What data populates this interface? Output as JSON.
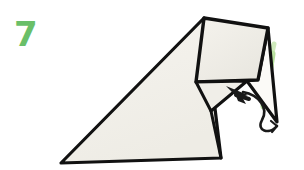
{
  "figure": {
    "step_number": "7",
    "step_number_color": "#6abf68",
    "background_color": "#ffffff",
    "paper_fill_color": "#f2f0ea",
    "paper_shade_color": "#e9e7e0",
    "outline_color": "#111111",
    "arrow_color": "#1a1a1a",
    "fold_hint_color": "#a8d98a"
  },
  "shapes": {
    "main_body": {
      "name": "main-paper-body",
      "points": "204,18 221,158 61,163"
    },
    "main_body_right": {
      "name": "main-paper-right-panel",
      "points": "204,18 196,82 211,110 221,158"
    },
    "top_flap": {
      "name": "top-folded-flap",
      "points": "204,18 268,28 258,80 196,82"
    },
    "narrow_flap": {
      "name": "narrow-right-flap",
      "points": "268,28 277,122 246,82 258,80"
    },
    "inner_fold": {
      "name": "inner-fold-triangle",
      "points": "196,82 246,82 211,110"
    }
  },
  "annotations": {
    "fold_arrow": {
      "name": "fold-direction-arrow",
      "label": "fold left",
      "head_tip": "227,87",
      "tail_curve": "M 243,93 C 258,96 268,108 262,120 C 256,131 268,134 275,127"
    },
    "green_crease": {
      "name": "green-crease-hint",
      "label": "crease line",
      "path": "M 272,54 L 264,106"
    }
  },
  "canvas": {
    "width": "304",
    "height": "170"
  }
}
